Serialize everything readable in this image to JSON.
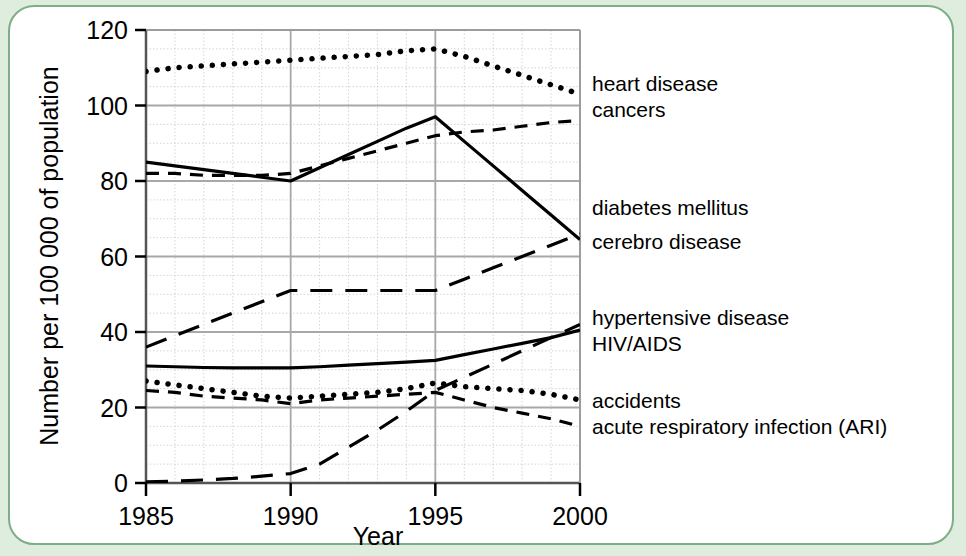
{
  "figure": {
    "background_color": "#dfeddf",
    "panel_color": "#ffffff",
    "panel_border_color": "#7fad85"
  },
  "chart_data": {
    "type": "line",
    "title": "",
    "xlabel": "Year",
    "ylabel": "Number per 100 000 of population",
    "xlim": [
      1985,
      2000
    ],
    "ylim": [
      0,
      120
    ],
    "xticks": [
      "1985",
      "1990",
      "1995",
      "2000"
    ],
    "yticks": [
      "0",
      "20",
      "40",
      "60",
      "80",
      "100",
      "120"
    ],
    "grid": "major grey lines plus fine dotted minor grid",
    "legend_position": "right of plot, inline at series end",
    "x": [
      1985,
      1986,
      1987,
      1988,
      1989,
      1990,
      1991,
      1992,
      1993,
      1994,
      1995,
      1996,
      1997,
      1998,
      1999,
      2000
    ],
    "series": [
      {
        "name": "heart disease",
        "style": "dotted",
        "values": [
          109,
          110,
          110.5,
          111,
          111.5,
          112,
          112.5,
          113,
          113.5,
          114.5,
          115,
          113,
          110.5,
          108,
          105.5,
          103
        ],
        "label_y_value": 106
      },
      {
        "name": "cancers",
        "style": "dashed",
        "values": [
          82,
          82,
          81.5,
          81.5,
          81.5,
          82,
          84,
          86,
          88,
          90,
          92,
          93,
          93.5,
          94.5,
          95.5,
          96
        ],
        "label_y_value": 99
      },
      {
        "name": "diabetes mellitus",
        "style": "long-dashed",
        "values": [
          36,
          39,
          42,
          45,
          48,
          51,
          51,
          51,
          51,
          51,
          51,
          54,
          57,
          60,
          63,
          66
        ],
        "label_y_value": 73
      },
      {
        "name": "cerebro disease",
        "style": "solid",
        "values": [
          85,
          84,
          83,
          82,
          81,
          80,
          83.5,
          87,
          90.5,
          94,
          97,
          90.5,
          84,
          77.5,
          71,
          64.5
        ],
        "label_y_value": 64
      },
      {
        "name": "hypertensive disease",
        "style": "solid",
        "values": [
          31,
          30.8,
          30.6,
          30.5,
          30.5,
          30.5,
          30.8,
          31.2,
          31.6,
          32,
          32.5,
          34,
          35.5,
          37,
          38.5,
          40.5
        ],
        "label_y_value": 44
      },
      {
        "name": "HIV/AIDS",
        "style": "long-dashed",
        "values": [
          0.3,
          0.5,
          0.8,
          1.2,
          1.8,
          2.5,
          5,
          9.5,
          14,
          19,
          24.5,
          28,
          31.5,
          35,
          38.5,
          42
        ],
        "label_y_value": 37
      },
      {
        "name": "accidents",
        "style": "dotted",
        "values": [
          27,
          26,
          25,
          24,
          23,
          22.5,
          23,
          23.5,
          24,
          25,
          26.5,
          25.5,
          25,
          24.5,
          23.5,
          22
        ],
        "label_y_value": 22
      },
      {
        "name": "acute respiratory infection (ARI)",
        "style": "dashed",
        "values": [
          24.5,
          24,
          23,
          22.5,
          22,
          21,
          22,
          22.5,
          23,
          23.5,
          24,
          22,
          20,
          18.5,
          17,
          15
        ],
        "label_y_value": 15
      }
    ]
  },
  "labels": {
    "y_axis_title": "Number per 100 000 of population",
    "x_axis_title": "Year",
    "x_tick_1985": "1985",
    "x_tick_1990": "1990",
    "x_tick_1995": "1995",
    "x_tick_2000": "2000",
    "y_tick_0": "0",
    "y_tick_20": "20",
    "y_tick_40": "40",
    "y_tick_60": "60",
    "y_tick_80": "80",
    "y_tick_100": "100",
    "y_tick_120": "120",
    "series_heart_disease": "heart disease",
    "series_cancers": "cancers",
    "series_diabetes": "diabetes mellitus",
    "series_cerebro": "cerebro disease",
    "series_hypertensive": "hypertensive disease",
    "series_hiv_aids": "HIV/AIDS",
    "series_accidents": "accidents",
    "series_ari": "acute respiratory infection (ARI)"
  }
}
